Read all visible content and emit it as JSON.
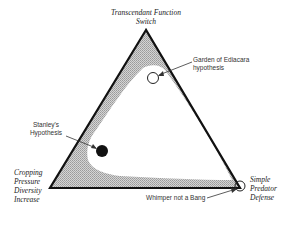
{
  "diagram": {
    "type": "ternary-triangle",
    "vertices": {
      "top": {
        "label_lines": [
          "Transcendant Function",
          "Switch"
        ]
      },
      "bottom_left": {
        "label_lines": [
          "Cropping",
          "Pressure",
          "Diversity",
          "Increase"
        ]
      },
      "bottom_right": {
        "label_lines": [
          "Simple",
          "Predator",
          "Defense"
        ]
      }
    },
    "points": [
      {
        "name": "Garden of Ediacara hypothesis",
        "label_lines": [
          "Garden of Ediacara",
          "hypothesis"
        ],
        "marker": "open-circle"
      },
      {
        "name": "Stanley's Hypothesis",
        "label_lines": [
          "Stanley's",
          "Hypothesis"
        ],
        "marker": "filled-circle"
      },
      {
        "name": "Whimper not a Bang",
        "label_lines": [
          "Whimper not a Bang"
        ],
        "marker": "open-circle"
      }
    ],
    "colors": {
      "outline": "#111111",
      "shaded_band": "#b8b8b8",
      "interior": "#ffffff",
      "filled_marker": "#111111"
    }
  }
}
